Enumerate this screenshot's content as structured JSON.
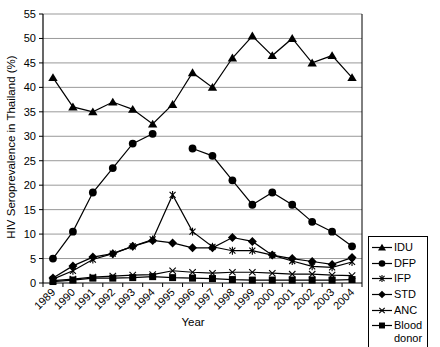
{
  "chart_data": {
    "type": "line",
    "title": "",
    "xlabel": "Year",
    "ylabel": "HIV Seroprevalence in Thailand (%)",
    "ylim": [
      0,
      55
    ],
    "ytick_step": 5,
    "ytick_labels": [
      "0",
      "5",
      "10",
      "15",
      "20",
      "25",
      "30",
      "35",
      "40",
      "45",
      "50",
      "55"
    ],
    "grid": "horizontal",
    "legend_position": "outside-right-bottom",
    "categories": [
      "1989",
      "1990",
      "1991",
      "1992",
      "1993",
      "1994",
      "1995",
      "1996",
      "1997",
      "1998",
      "1999",
      "2000",
      "2001",
      "2002",
      "2003",
      "2004"
    ],
    "series": [
      {
        "name": "IDU",
        "marker": "triangle-icon",
        "values": [
          42,
          36,
          35,
          37,
          35.5,
          32.5,
          36.5,
          43,
          40,
          46,
          50.5,
          46.5,
          50,
          45,
          46.5,
          42
        ]
      },
      {
        "name": "DFP",
        "marker": "circle-icon",
        "values": [
          5,
          10.5,
          18.5,
          23.5,
          28.5,
          30.5,
          null,
          27.5,
          26,
          21,
          16,
          18.5,
          16,
          12.5,
          10.5,
          7.5
        ]
      },
      {
        "name": "IFP",
        "marker": "asterisk-icon",
        "values": [
          0.8,
          2.5,
          4.8,
          6,
          7.5,
          8.9,
          18,
          10.5,
          7.4,
          6.6,
          6.6,
          5.7,
          4.5,
          3.4,
          3.2,
          4.3
        ]
      },
      {
        "name": "STD",
        "marker": "diamond-icon",
        "values": [
          1,
          3.5,
          5.3,
          6,
          7.5,
          8.7,
          8.2,
          7.2,
          7.2,
          9.3,
          8.5,
          5.7,
          5,
          4.4,
          3.8,
          5.2
        ]
      },
      {
        "name": "ANC",
        "marker": "x-icon",
        "values": [
          0.5,
          0.8,
          1.2,
          1.4,
          1.6,
          1.7,
          2.5,
          2.2,
          2,
          2.2,
          2.2,
          2,
          1.8,
          1.8,
          1.6,
          1.5
        ]
      },
      {
        "name": "Blood donor",
        "marker": "square-icon",
        "values": [
          0.3,
          0.6,
          1,
          1,
          1.1,
          1.3,
          1.1,
          1,
          0.9,
          0.7,
          0.6,
          0.6,
          0.6,
          0.6,
          0.6,
          0.7
        ]
      }
    ],
    "colors": {
      "series": "#000000",
      "gridline": "#999999",
      "axis": "#000000",
      "background": "#ffffff",
      "text": "#000000"
    }
  }
}
